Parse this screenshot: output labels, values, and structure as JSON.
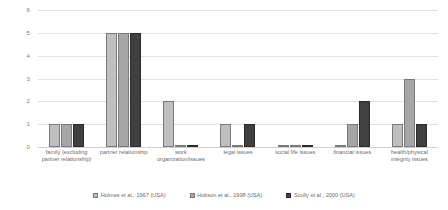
{
  "chart_data": {
    "type": "bar",
    "title": "",
    "xlabel": "",
    "ylabel": "",
    "ylim": [
      0,
      6
    ],
    "yticks": [
      6,
      5,
      4,
      3,
      2,
      1,
      0
    ],
    "grid": true,
    "legend_position": "bottom",
    "categories": [
      "family (excluding partner relationship)",
      "partner relationship",
      "work organization/issues",
      "legal issues",
      "social life issues",
      "financial issues",
      "health/physical integrity issues"
    ],
    "series": [
      {
        "name": "Holmes et al., 1967 (USA)",
        "color": "#bfbfbf",
        "values": [
          1,
          5,
          2,
          1,
          0,
          0,
          1
        ]
      },
      {
        "name": "Hobson et al., 1998 (USA)",
        "color": "#a6a6a6",
        "values": [
          1,
          5,
          0,
          0,
          0,
          1,
          3
        ]
      },
      {
        "name": "Scully et al., 2000 (USA)",
        "color": "#404040",
        "values": [
          1,
          5,
          0,
          1,
          0,
          2,
          1
        ]
      }
    ]
  }
}
